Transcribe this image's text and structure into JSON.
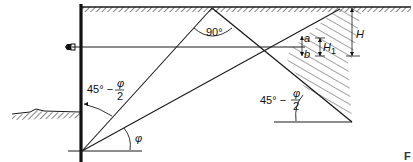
{
  "diagram": {
    "labels": {
      "apex_angle": "90°",
      "left_angle_main": "45° −",
      "left_angle_num": "φ",
      "left_angle_den": "2",
      "phi_angle": "φ",
      "right_angle_main": "45° −",
      "right_angle_num": "φ",
      "right_angle_den": "2",
      "dim_a": "a",
      "dim_b": "b",
      "dim_H1": "H",
      "dim_H1_sub": "1",
      "dim_H": "H",
      "figure_marker": "F"
    },
    "colors": {
      "line": "#1a1a1a",
      "hatch": "#333333",
      "background": "#ffffff"
    },
    "elements": [
      "sheet-pile-wall",
      "ground-surface-backfill",
      "ground-surface-dredge-line",
      "anchor-tie-rod",
      "anchor-head",
      "active-failure-plane",
      "passive-failure-plane",
      "deadman-anchor-zone-hatched"
    ]
  }
}
